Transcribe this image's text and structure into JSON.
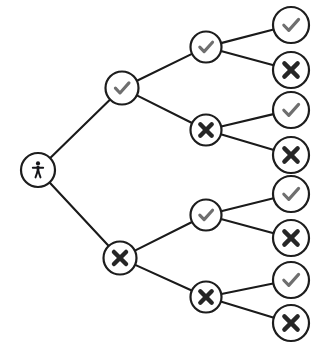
{
  "diagram": {
    "kind": "binary-decision-tree",
    "background_color": "#ffffff",
    "edge_color": "#1a1a1a",
    "node_fill": "#ffffff",
    "node_stroke": "#1d1d1d",
    "check_color": "#6f6f6f",
    "cross_color": "#262626",
    "person_color": "#15161a",
    "levels": 4,
    "leaf_count": 8
  },
  "nodes": [
    {
      "id": "root",
      "icon": "person-icon",
      "label": "person",
      "level": 0,
      "cx": 38,
      "cy": 170,
      "r": 17
    },
    {
      "id": "n-c",
      "icon": "check-icon",
      "label": "check",
      "level": 1,
      "cx": 122,
      "cy": 88,
      "r": 16.5
    },
    {
      "id": "n-x",
      "icon": "cross-icon",
      "label": "cross",
      "level": 1,
      "cx": 120,
      "cy": 258,
      "r": 16.5
    },
    {
      "id": "n-cc",
      "icon": "check-icon",
      "label": "check",
      "level": 2,
      "cx": 206,
      "cy": 47,
      "r": 15.5
    },
    {
      "id": "n-cx",
      "icon": "cross-icon",
      "label": "cross",
      "level": 2,
      "cx": 206,
      "cy": 130,
      "r": 15.5
    },
    {
      "id": "n-xc",
      "icon": "check-icon",
      "label": "check",
      "level": 2,
      "cx": 206,
      "cy": 215,
      "r": 15.5
    },
    {
      "id": "n-xx",
      "icon": "cross-icon",
      "label": "cross",
      "level": 2,
      "cx": 206,
      "cy": 297,
      "r": 15.5
    },
    {
      "id": "n-ccc",
      "icon": "check-icon",
      "label": "check",
      "level": 3,
      "cx": 291,
      "cy": 25,
      "r": 18
    },
    {
      "id": "n-ccx",
      "icon": "cross-icon",
      "label": "cross",
      "level": 3,
      "cx": 291,
      "cy": 70,
      "r": 18
    },
    {
      "id": "n-cxc",
      "icon": "check-icon",
      "label": "check",
      "level": 3,
      "cx": 291,
      "cy": 110,
      "r": 18
    },
    {
      "id": "n-cxx",
      "icon": "cross-icon",
      "label": "cross",
      "level": 3,
      "cx": 291,
      "cy": 155,
      "r": 18
    },
    {
      "id": "n-xcc",
      "icon": "check-icon",
      "label": "check",
      "level": 3,
      "cx": 291,
      "cy": 194,
      "r": 18
    },
    {
      "id": "n-xcx",
      "icon": "cross-icon",
      "label": "cross",
      "level": 3,
      "cx": 291,
      "cy": 238,
      "r": 18
    },
    {
      "id": "n-xxc",
      "icon": "check-icon",
      "label": "check",
      "level": 3,
      "cx": 291,
      "cy": 280,
      "r": 18
    },
    {
      "id": "n-xxx",
      "icon": "cross-icon",
      "label": "cross",
      "level": 3,
      "cx": 291,
      "cy": 323,
      "r": 18
    }
  ],
  "edges": [
    {
      "from": "root",
      "to": "n-c"
    },
    {
      "from": "root",
      "to": "n-x"
    },
    {
      "from": "n-c",
      "to": "n-cc"
    },
    {
      "from": "n-c",
      "to": "n-cx"
    },
    {
      "from": "n-x",
      "to": "n-xc"
    },
    {
      "from": "n-x",
      "to": "n-xx"
    },
    {
      "from": "n-cc",
      "to": "n-ccc"
    },
    {
      "from": "n-cc",
      "to": "n-ccx"
    },
    {
      "from": "n-cx",
      "to": "n-cxc"
    },
    {
      "from": "n-cx",
      "to": "n-cxx"
    },
    {
      "from": "n-xc",
      "to": "n-xcc"
    },
    {
      "from": "n-xc",
      "to": "n-xcx"
    },
    {
      "from": "n-xx",
      "to": "n-xxc"
    },
    {
      "from": "n-xx",
      "to": "n-xxx"
    }
  ]
}
